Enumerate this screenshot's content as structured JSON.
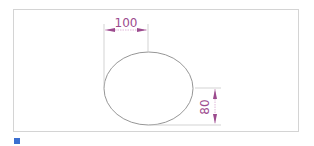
{
  "diagram": {
    "type": "ellipse-dimension-drawing",
    "shape": "ellipse",
    "dimensions": {
      "horizontal": {
        "label": "100",
        "orientation": "horizontal"
      },
      "vertical": {
        "label": "80",
        "orientation": "vertical"
      }
    },
    "colors": {
      "frame": "#d4d4d4",
      "outline": "#8a8a8a",
      "dimension": "#9c4b8e",
      "extension_line": "#c8c8c8",
      "marker": "#3b6fd0"
    }
  }
}
